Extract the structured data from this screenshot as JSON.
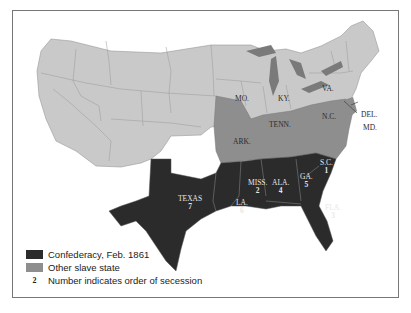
{
  "map": {
    "title": "Secession of Southern States",
    "colors": {
      "free_state": "#c9c9c9",
      "confederacy": "#2b2b2b",
      "other_slave_state": "#8e8e8e",
      "water": "#ffffff",
      "lakes": "#7a7a7a",
      "border": "#888888"
    },
    "confederate_states": [
      {
        "abbr": "S.C.",
        "order": "1"
      },
      {
        "abbr": "MISS.",
        "order": "2"
      },
      {
        "abbr": "FLA.",
        "order": "3"
      },
      {
        "abbr": "ALA.",
        "order": "4"
      },
      {
        "abbr": "GA.",
        "order": "5"
      },
      {
        "abbr": "LA.",
        "order": "6"
      },
      {
        "abbr": "TEXAS",
        "order": "7"
      }
    ],
    "other_slave_states": [
      {
        "abbr": "MO."
      },
      {
        "abbr": "KY."
      },
      {
        "abbr": "VA."
      },
      {
        "abbr": "N.C."
      },
      {
        "abbr": "TENN."
      },
      {
        "abbr": "ARK."
      },
      {
        "abbr": "DEL."
      },
      {
        "abbr": "MD."
      }
    ]
  },
  "legend": {
    "items": [
      {
        "label": "Confederacy, Feb. 1861",
        "color": "#2b2b2b"
      },
      {
        "label": "Other slave state",
        "color": "#8e8e8e"
      },
      {
        "symbol": "2",
        "label": "Number indicates order of secession"
      }
    ]
  }
}
